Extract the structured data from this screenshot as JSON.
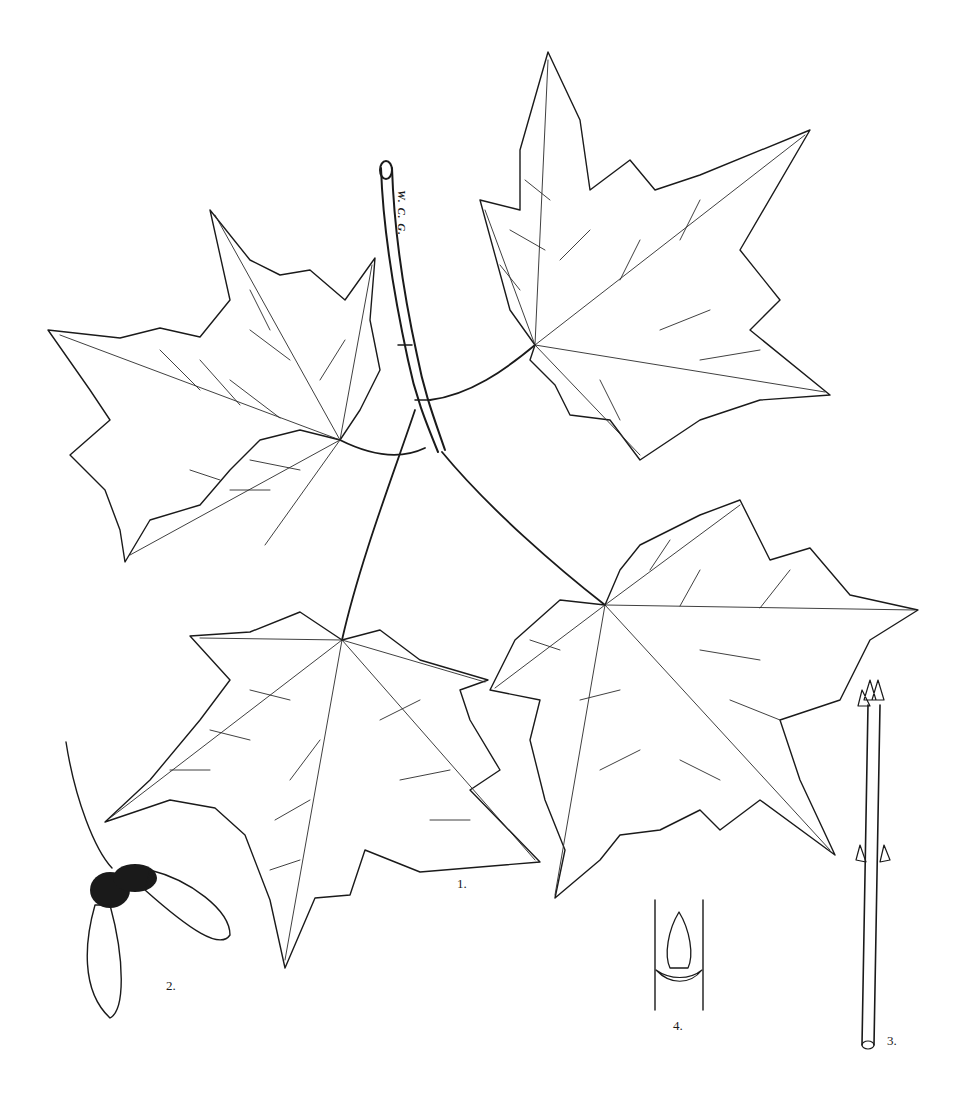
{
  "plate": {
    "subject": "Maple botanical illustration",
    "signature": "W. C. G.",
    "background": "#ffffff",
    "ink": "#1a1a1a"
  },
  "figures": [
    {
      "id": "1",
      "label": "1.",
      "depicts": "leafy shoot with four leaves"
    },
    {
      "id": "2",
      "label": "2.",
      "depicts": "samara (winged fruit)"
    },
    {
      "id": "3",
      "label": "3.",
      "depicts": "winter twig with buds"
    },
    {
      "id": "4",
      "label": "4.",
      "depicts": "bud detail with leaf scar"
    }
  ]
}
